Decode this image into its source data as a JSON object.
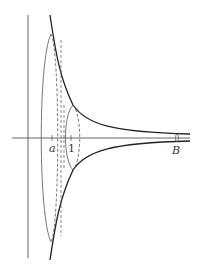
{
  "diagram": {
    "title": "",
    "labels": {
      "a": "a",
      "one": "1",
      "B": "B"
    },
    "colors": {
      "curve": "#222222",
      "axes": "#555555",
      "ellipse": "#555555",
      "background": "#ffffff"
    }
  }
}
